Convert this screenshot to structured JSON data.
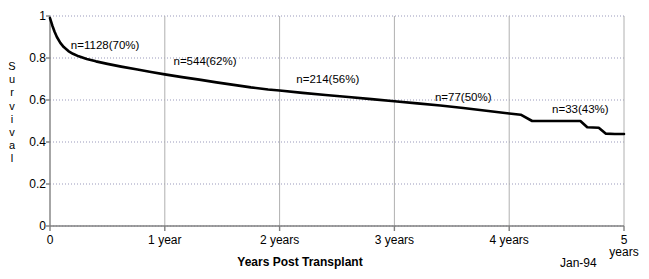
{
  "chart_data": {
    "type": "line",
    "title": "",
    "xlabel": "Years Post Transplant",
    "ylabel": "Survival",
    "date_stamp": "Jan-94",
    "grid": true,
    "legend": "none",
    "xlim": [
      0,
      5
    ],
    "ylim": [
      0,
      1
    ],
    "x_tick_labels": [
      "0",
      "1 year",
      "2 years",
      "3 years",
      "4 years",
      "5 years"
    ],
    "x_tick_values": [
      0,
      1,
      2,
      3,
      4,
      5
    ],
    "y_tick_labels": [
      "0",
      "0.2",
      "0.4",
      "0.6",
      "0.8",
      "1"
    ],
    "y_tick_values": [
      0,
      0.2,
      0.4,
      0.6,
      0.8,
      1
    ],
    "ylabel_letters": [
      "S",
      "u",
      "r",
      "v",
      "i",
      "v",
      "a",
      "l"
    ],
    "series": [
      {
        "name": "Survival",
        "x": [
          0.0,
          0.02,
          0.04,
          0.06,
          0.09,
          0.12,
          0.16,
          0.2,
          0.25,
          0.32,
          0.4,
          0.5,
          0.62,
          0.75,
          0.88,
          1.0,
          1.15,
          1.3,
          1.45,
          1.6,
          1.75,
          1.9,
          2.0,
          2.2,
          2.4,
          2.6,
          2.8,
          3.0,
          3.2,
          3.4,
          3.6,
          3.8,
          4.0,
          4.1,
          4.2,
          4.35,
          4.5,
          4.62,
          4.68,
          4.78,
          4.84,
          4.92,
          5.0
        ],
        "y": [
          0.99,
          0.955,
          0.925,
          0.9,
          0.872,
          0.852,
          0.833,
          0.82,
          0.808,
          0.795,
          0.784,
          0.772,
          0.759,
          0.746,
          0.733,
          0.722,
          0.709,
          0.697,
          0.684,
          0.672,
          0.66,
          0.65,
          0.645,
          0.634,
          0.624,
          0.614,
          0.604,
          0.594,
          0.584,
          0.574,
          0.562,
          0.549,
          0.536,
          0.53,
          0.5,
          0.5,
          0.5,
          0.5,
          0.47,
          0.468,
          0.44,
          0.438,
          0.438
        ]
      }
    ],
    "annotations": [
      {
        "text": "n=1128(70%)",
        "x": 0.48,
        "y": 0.845
      },
      {
        "text": "n=544(62%)",
        "x": 1.35,
        "y": 0.765
      },
      {
        "text": "n=214(56%)",
        "x": 2.42,
        "y": 0.68
      },
      {
        "text": "n=77(50%)",
        "x": 3.6,
        "y": 0.595
      },
      {
        "text": "n=33(43%)",
        "x": 4.62,
        "y": 0.54
      }
    ],
    "colors": {
      "curve": "#000000",
      "axis": "#808080",
      "grid": "#9999bb",
      "background": "#ffffff"
    }
  }
}
